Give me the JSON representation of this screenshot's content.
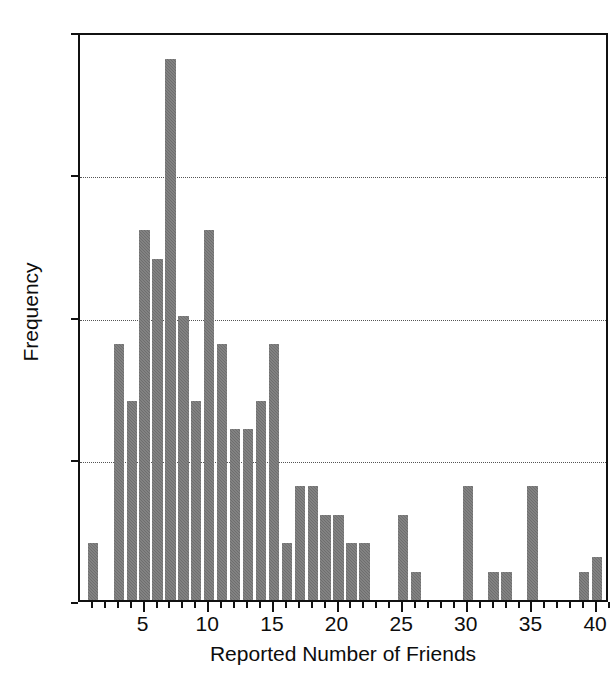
{
  "chart_data": {
    "type": "bar",
    "title": "",
    "xlabel": "Reported Number of Friends",
    "ylabel": "Frequency",
    "xlim": [
      0,
      41
    ],
    "ylim": [
      0,
      20
    ],
    "grid": true,
    "gridlines_y": [
      5,
      10,
      15
    ],
    "legend": null,
    "bar_color": "#6e6e6e",
    "axis_color": "#111111",
    "categories": [
      1,
      2,
      3,
      4,
      5,
      6,
      7,
      8,
      9,
      10,
      11,
      12,
      13,
      14,
      15,
      16,
      17,
      18,
      19,
      20,
      21,
      22,
      23,
      24,
      25,
      26,
      27,
      28,
      29,
      30,
      31,
      32,
      33,
      34,
      35,
      36,
      37,
      38,
      39,
      40
    ],
    "values": [
      2,
      0,
      9,
      7,
      13,
      12,
      19,
      10,
      7,
      13,
      9,
      6,
      6,
      7,
      9,
      2,
      4,
      4,
      3,
      3,
      2,
      2,
      0,
      0,
      3,
      1,
      0,
      0,
      0,
      4,
      0,
      1,
      1,
      0,
      4,
      0,
      0,
      0,
      1,
      1.5
    ],
    "x_ticks_major": [
      5,
      10,
      15,
      20,
      25,
      30,
      35,
      40
    ],
    "x_tick_labels": [
      "5",
      "10",
      "15",
      "20",
      "25",
      "30",
      "35",
      "40"
    ],
    "y_ticks": [
      0,
      5,
      10,
      15,
      20
    ],
    "y_tick_labels": [
      "0",
      "5",
      "10",
      "15",
      "20"
    ]
  }
}
